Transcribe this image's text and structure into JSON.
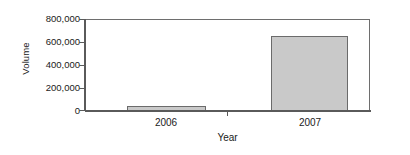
{
  "chart_data": {
    "type": "bar",
    "title": "",
    "subtitle": "",
    "xlabel": "Year",
    "ylabel": "Volume",
    "categories": [
      "2006",
      "2007"
    ],
    "values": [
      45000,
      650000
    ],
    "series": [
      {
        "name": "Volume",
        "values": [
          45000,
          650000
        ]
      }
    ],
    "ylim": [
      0,
      800000
    ],
    "yticks": [
      0,
      200000,
      400000,
      600000,
      800000
    ],
    "ytick_labels": [
      "0",
      "200,000",
      "400,000",
      "600,000",
      "800,000"
    ],
    "xtick_labels": [
      "2006",
      "2007"
    ],
    "grid": false,
    "legend": false,
    "legend_position": "none",
    "bar_fill_color": "#c9c9c9",
    "bar_edge_color": "#6b6b6b",
    "axis_color": "#5a5a5a",
    "frame_color": "#6e6e6e",
    "background_color": "#ffffff",
    "text_color": "#1a1a1a"
  }
}
